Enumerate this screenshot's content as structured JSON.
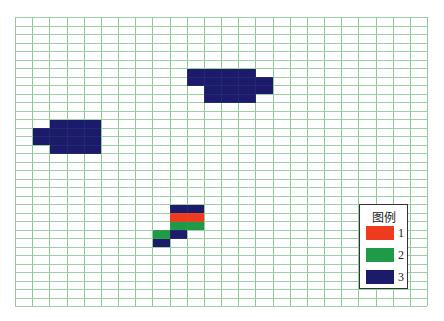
{
  "grid": {
    "cols": 24,
    "rows": 34,
    "line_color": "#8fc99a",
    "origin": [
      15,
      17
    ],
    "cell_w": 17.17,
    "cell_h": 8.5
  },
  "colors": {
    "1": "#ee3b1d",
    "2": "#1f9a48",
    "3": "#1c1a6b"
  },
  "cells": [
    {
      "col": 10,
      "row": 6,
      "w": 4,
      "h": 2,
      "cls": "3"
    },
    {
      "col": 11,
      "row": 8,
      "w": 3,
      "h": 2,
      "cls": "3"
    },
    {
      "col": 14,
      "row": 7,
      "w": 1,
      "h": 2,
      "cls": "3"
    },
    {
      "col": 2,
      "row": 12,
      "w": 3,
      "h": 4,
      "cls": "3"
    },
    {
      "col": 1,
      "row": 13,
      "w": 1,
      "h": 2,
      "cls": "3"
    },
    {
      "col": 9,
      "row": 22,
      "w": 2,
      "h": 1,
      "cls": "3"
    },
    {
      "col": 9,
      "row": 23,
      "w": 2,
      "h": 1,
      "cls": "1"
    },
    {
      "col": 9,
      "row": 24,
      "w": 2,
      "h": 1,
      "cls": "2"
    },
    {
      "col": 8,
      "row": 25,
      "w": 1,
      "h": 1,
      "cls": "2"
    },
    {
      "col": 9,
      "row": 25,
      "w": 1,
      "h": 1,
      "cls": "3"
    },
    {
      "col": 8,
      "row": 26,
      "w": 1,
      "h": 1,
      "cls": "3"
    }
  ],
  "legend": {
    "title": "图例",
    "items": [
      {
        "label": "1",
        "color": "#ee3b1d"
      },
      {
        "label": "2",
        "color": "#1f9a48"
      },
      {
        "label": "3",
        "color": "#1c1a6b"
      }
    ]
  }
}
